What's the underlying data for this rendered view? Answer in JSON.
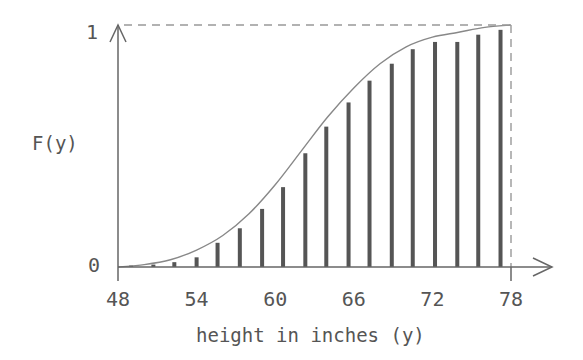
{
  "chart_data": {
    "type": "bar",
    "title": "",
    "xlabel": "height in inches (y)",
    "ylabel": "F(y)",
    "xlim": [
      48,
      78
    ],
    "ylim": [
      0,
      1
    ],
    "x_ticks": [
      "48",
      "54",
      "60",
      "66",
      "72",
      "78"
    ],
    "x_tick_values": [
      48,
      54,
      60,
      66,
      72,
      78
    ],
    "y_ticks": [
      "0",
      "1"
    ],
    "y_tick_values": [
      0,
      1
    ],
    "grid": false,
    "legend": "none",
    "colors": {
      "bars": "#555555",
      "curve": "#888888",
      "axes": "#666666",
      "dashed": "#999999"
    },
    "series": [
      {
        "name": "cumulative relative frequency (bars)",
        "x": [
          49.0,
          50.7,
          52.3,
          54.0,
          55.6,
          57.3,
          59.0,
          60.6,
          62.3,
          63.9,
          65.6,
          67.2,
          68.9,
          70.5,
          72.2,
          73.9,
          75.5,
          77.2
        ],
        "values": [
          0.005,
          0.01,
          0.02,
          0.04,
          0.1,
          0.16,
          0.24,
          0.33,
          0.47,
          0.58,
          0.68,
          0.77,
          0.84,
          0.9,
          0.93,
          0.93,
          0.96,
          0.98
        ]
      },
      {
        "name": "F(y) smooth CDF curve",
        "type": "line",
        "x": [
          48,
          50,
          52,
          54,
          56,
          58,
          60,
          62,
          64,
          66,
          68,
          70,
          72,
          74,
          76,
          78
        ],
        "values": [
          0.0,
          0.01,
          0.03,
          0.07,
          0.13,
          0.22,
          0.34,
          0.48,
          0.62,
          0.74,
          0.84,
          0.91,
          0.95,
          0.97,
          0.99,
          1.0
        ]
      }
    ],
    "annotations": [
      "dashed line at F(y)=1",
      "dashed vertical line at y=78"
    ]
  }
}
